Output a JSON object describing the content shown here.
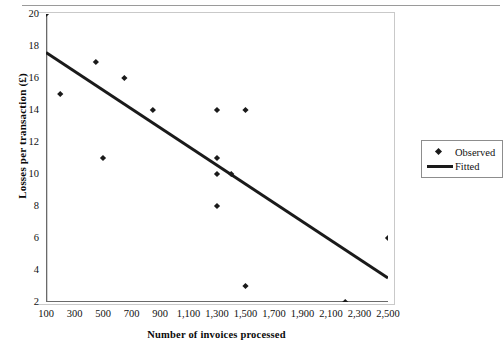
{
  "chart_data": {
    "type": "scatter",
    "title": "",
    "xlabel": "Number of invoices processed",
    "ylabel": "Losses per transaction (£)",
    "xlim": [
      100,
      2500
    ],
    "ylim": [
      2,
      20
    ],
    "xticks": [
      100,
      300,
      500,
      700,
      900,
      1100,
      1300,
      1500,
      1700,
      1900,
      2100,
      2300,
      2500
    ],
    "xticklabels": [
      "100",
      "300",
      "500",
      "700",
      "900",
      "1,100",
      "1,300",
      "1,500",
      "1,700",
      "1,900",
      "2,100",
      "2,300",
      "2,500"
    ],
    "yticks": [
      2,
      4,
      6,
      8,
      10,
      12,
      14,
      16,
      18,
      20
    ],
    "yticklabels": [
      "2",
      "4",
      "6",
      "8",
      "10",
      "12",
      "14",
      "16",
      "18",
      "20"
    ],
    "grid": false,
    "legend_position": "right",
    "series": [
      {
        "name": "Observed",
        "type": "scatter",
        "marker": "diamond",
        "color": "#1a1a1a",
        "points": [
          {
            "x": 100,
            "y": 20
          },
          {
            "x": 200,
            "y": 15
          },
          {
            "x": 450,
            "y": 17
          },
          {
            "x": 500,
            "y": 11
          },
          {
            "x": 650,
            "y": 16
          },
          {
            "x": 850,
            "y": 14
          },
          {
            "x": 1300,
            "y": 14
          },
          {
            "x": 1300,
            "y": 11
          },
          {
            "x": 1300,
            "y": 10
          },
          {
            "x": 1300,
            "y": 8
          },
          {
            "x": 1400,
            "y": 10
          },
          {
            "x": 1500,
            "y": 14
          },
          {
            "x": 1500,
            "y": 3
          },
          {
            "x": 2200,
            "y": 2
          },
          {
            "x": 2500,
            "y": 6
          }
        ]
      },
      {
        "name": "Fitted",
        "type": "line",
        "color": "#1a1a1a",
        "linewidth": 3,
        "points": [
          {
            "x": 100,
            "y": 17.6
          },
          {
            "x": 2500,
            "y": 3.5
          }
        ]
      }
    ]
  },
  "legend": {
    "items": [
      {
        "label": "Observed",
        "key": "diamond"
      },
      {
        "label": "Fitted",
        "key": "line"
      }
    ]
  }
}
